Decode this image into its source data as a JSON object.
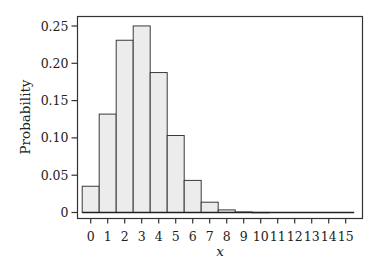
{
  "chart_data": {
    "type": "bar",
    "title": "",
    "xlabel": "x",
    "ylabel": "Probability",
    "categories": [
      "0",
      "1",
      "2",
      "3",
      "4",
      "5",
      "6",
      "7",
      "8",
      "9",
      "10",
      "11",
      "12",
      "13",
      "14",
      "15"
    ],
    "values": [
      0.0352,
      0.1319,
      0.2309,
      0.2501,
      0.1876,
      0.1032,
      0.043,
      0.0138,
      0.0035,
      0.0007,
      0.0001,
      0.0,
      0.0,
      0.0,
      0.0,
      0.0
    ],
    "ylim": [
      0,
      0.25
    ],
    "yticks": [
      0,
      0.05,
      0.1,
      0.15,
      0.2,
      0.25
    ],
    "ytick_labels": [
      "0",
      "0.05",
      "0.10",
      "0.15",
      "0.20",
      "0.25"
    ],
    "xticks": [
      0,
      1,
      2,
      3,
      4,
      5,
      6,
      7,
      8,
      9,
      10,
      11,
      12,
      13,
      14,
      15
    ],
    "xtick_labels": [
      "0",
      "1",
      "2",
      "3",
      "4",
      "5",
      "6",
      "7",
      "8",
      "9",
      "10",
      "11",
      "12",
      "13",
      "14",
      "15"
    ],
    "grid": false,
    "legend": "none",
    "colors": {
      "bar_fill": "#ececec",
      "bar_stroke": "#3a3a3a",
      "axis": "#333333"
    }
  }
}
